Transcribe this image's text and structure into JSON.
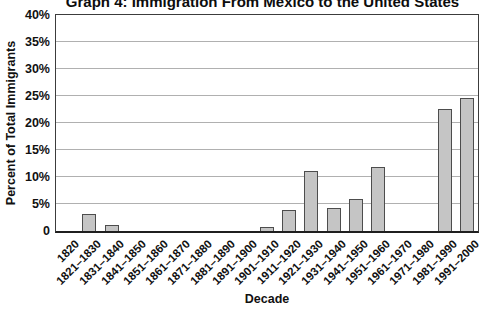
{
  "chart_data": {
    "type": "bar",
    "title": "Graph 4: Immigration From Mexico to the United States",
    "xlabel": "Decade",
    "ylabel": "Percent of Total Immigrants",
    "categories": [
      "1820",
      "1821–1830",
      "1831–1840",
      "1841–1850",
      "1851–1860",
      "1861–1870",
      "1871–1880",
      "1881–1890",
      "1891–1900",
      "1901–1910",
      "1911–1920",
      "1921–1930",
      "1931–1940",
      "1941–1950",
      "1951–1960",
      "1961–1970",
      "1971–1980",
      "1981–1990",
      "1991–2000"
    ],
    "values": [
      0,
      3.2,
      1.1,
      0,
      0,
      0,
      0,
      0,
      0,
      0.8,
      3.8,
      11.2,
      4.2,
      5.9,
      11.9,
      0,
      0,
      22.6,
      24.7
    ],
    "ylim": [
      0,
      40
    ],
    "ytick_step": 5,
    "ytick_labels": [
      "40%",
      "35%",
      "30%",
      "25%",
      "20%",
      "15%",
      "10%",
      "5%",
      "0"
    ],
    "grid": true,
    "legend": "none",
    "colors": {
      "bar_fill": "#c5c5c5",
      "bar_border": "#4d4d4d",
      "gridline": "#b0b0b0",
      "axis": "#3c3c3c",
      "text": "#111111"
    }
  }
}
